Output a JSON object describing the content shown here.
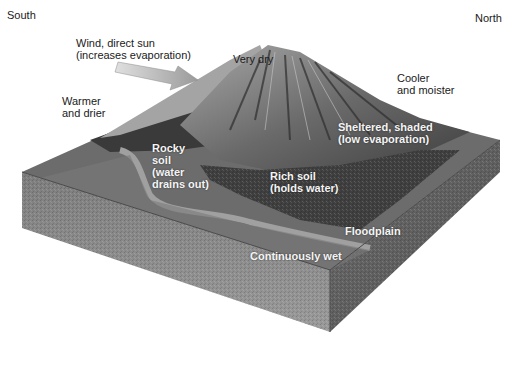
{
  "diagram": {
    "directions": {
      "south": "South",
      "north": "North"
    },
    "labels": {
      "wind": "Wind, direct sun\n(increases evaporation)",
      "very_dry": "Very dry",
      "warmer_drier": "Warmer\nand drier",
      "cooler_moister": "Cooler\nand moister",
      "sheltered": "Sheltered, shaded\n(low evaporation)",
      "rocky_soil": "Rocky\nsoil\n(water\ndrains out)",
      "rich_soil": "Rich soil\n(holds water)",
      "floodplain": "Floodplain",
      "continuously_wet": "Continuously wet"
    },
    "colors": {
      "background": "#ffffff",
      "text_dark": "#1a1a1a",
      "text_light": "#f4f4f4",
      "block_top": "#6e6e6e",
      "block_side_front": "#8a8a8a",
      "block_side_right": "#5f5f5f",
      "forest": "#3c3c3c",
      "mountain_light": "#9a9a9a",
      "mountain_dark": "#4a4a4a",
      "river": "#9c9c9c",
      "arrow": "#b5b5b5"
    }
  }
}
